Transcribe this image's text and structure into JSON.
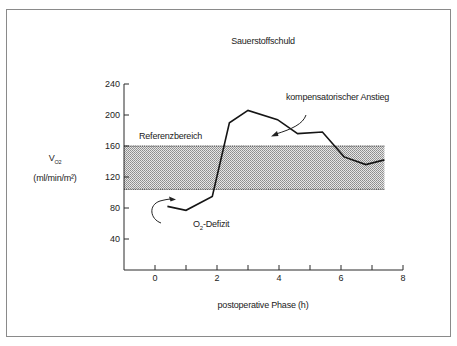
{
  "chart_data": {
    "type": "line",
    "title": "Sauerstoffschuld",
    "xlabel": "postoperative Phase (h)",
    "ylabel": "V̇O2 (ml/min/m²)",
    "ylabel_symbol": "V",
    "ylabel_subscript": "O2",
    "ylabel_unit": "(ml/min/m²)",
    "xlim": [
      -1,
      8
    ],
    "ylim": [
      0,
      240
    ],
    "x_ticks": [
      0,
      1,
      2,
      3,
      4,
      5,
      6,
      7,
      8
    ],
    "x_tick_labels": [
      "0",
      "",
      "2",
      "",
      "4",
      "",
      "6",
      "",
      "8"
    ],
    "y_ticks": [
      40,
      80,
      120,
      160,
      200,
      240
    ],
    "y_tick_labels": [
      "40",
      "80",
      "120",
      "160",
      "200",
      "240"
    ],
    "grid": false,
    "series": [
      {
        "name": "VO2",
        "x": [
          0.4,
          1.0,
          1.85,
          2.4,
          3.0,
          3.95,
          4.6,
          5.4,
          6.1,
          6.8,
          7.4
        ],
        "y": [
          82,
          77,
          95,
          190,
          206,
          194,
          176,
          178,
          146,
          136,
          142
        ]
      }
    ],
    "reference_band": {
      "label": "Referenzbereich",
      "y_min": 104,
      "y_max": 160,
      "x_min": -1,
      "x_max": 7.4
    },
    "annotations": [
      {
        "text": "kompensatorischer Anstieg",
        "type": "arrow-label"
      },
      {
        "text": "O2-Defizit",
        "text_main": "O",
        "text_sub": "2",
        "text_rest": "-Defizit",
        "type": "arrow-label"
      },
      {
        "text": "Referenzbereich",
        "type": "band-label"
      }
    ]
  },
  "labels": {
    "title": "Sauerstoffschuld",
    "xlabel": "postoperative Phase (h)",
    "y_symbol": "V",
    "y_sub": "O2",
    "y_unit": "(ml/min/m²)",
    "band": "Referenzbereich",
    "comp": "kompensatorischer Anstieg",
    "deficit_main": "O",
    "deficit_sub": "2",
    "deficit_rest": "-Defizit"
  },
  "colors": {
    "line": "#151515",
    "axis": "#2a2a2a",
    "band_fill": "#c9c9c9",
    "band_edge": "#333333",
    "frame": "#8a8a8a"
  }
}
